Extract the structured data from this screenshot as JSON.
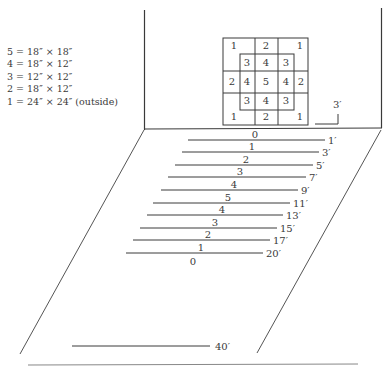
{
  "legend": {
    "items": [
      "5 = 18″ × 18″",
      "4 = 18″ × 12″",
      "3 = 12″ × 12″",
      "2 = 18″ × 12″",
      "1 = 24″ × 24″ (outside)"
    ]
  },
  "target": {
    "outer": {
      "x": 223,
      "y": 38,
      "w": 85,
      "h": 87
    },
    "inner": {
      "x": 240,
      "y": 54,
      "w": 54,
      "h": 56
    },
    "vlines": [
      255,
      278
    ],
    "hlines": [
      70,
      93
    ],
    "cells": [
      {
        "label": "1",
        "x": 234,
        "y": 49
      },
      {
        "label": "2",
        "x": 266,
        "y": 49
      },
      {
        "label": "1",
        "x": 300,
        "y": 49
      },
      {
        "label": "3",
        "x": 247,
        "y": 66
      },
      {
        "label": "4",
        "x": 266,
        "y": 66
      },
      {
        "label": "3",
        "x": 286,
        "y": 66
      },
      {
        "label": "2",
        "x": 232,
        "y": 85
      },
      {
        "label": "4",
        "x": 247,
        "y": 85
      },
      {
        "label": "5",
        "x": 266,
        "y": 85
      },
      {
        "label": "4",
        "x": 286,
        "y": 85
      },
      {
        "label": "2",
        "x": 301,
        "y": 85
      },
      {
        "label": "3",
        "x": 247,
        "y": 104
      },
      {
        "label": "4",
        "x": 266,
        "y": 104
      },
      {
        "label": "3",
        "x": 286,
        "y": 104
      },
      {
        "label": "1",
        "x": 234,
        "y": 120
      },
      {
        "label": "2",
        "x": 266,
        "y": 120
      },
      {
        "label": "1",
        "x": 300,
        "y": 120
      }
    ]
  },
  "height_marker": {
    "label": "3′"
  },
  "throw_lines": [
    {
      "score": "0",
      "distance": "1′",
      "x1": 188,
      "x2": 325,
      "y": 140,
      "lx": 255
    },
    {
      "score": "1",
      "distance": "3′",
      "x1": 182,
      "x2": 319,
      "y": 152,
      "lx": 252
    },
    {
      "score": "2",
      "distance": "5′",
      "x1": 175,
      "x2": 313,
      "y": 165,
      "lx": 246
    },
    {
      "score": "3",
      "distance": "7′",
      "x1": 168,
      "x2": 306,
      "y": 177,
      "lx": 240
    },
    {
      "score": "4",
      "distance": "9′",
      "x1": 161,
      "x2": 298,
      "y": 190,
      "lx": 234
    },
    {
      "score": "5",
      "distance": "11′",
      "x1": 153,
      "x2": 290,
      "y": 203,
      "lx": 228
    },
    {
      "score": "4",
      "distance": "13′",
      "x1": 147,
      "x2": 283,
      "y": 215,
      "lx": 222
    },
    {
      "score": "3",
      "distance": "15′",
      "x1": 140,
      "x2": 277,
      "y": 228,
      "lx": 215
    },
    {
      "score": "2",
      "distance": "17′",
      "x1": 133,
      "x2": 270,
      "y": 240,
      "lx": 208
    },
    {
      "score": "1",
      "distance": "20′",
      "x1": 126,
      "x2": 263,
      "y": 253,
      "lx": 201
    }
  ],
  "after_last_label": {
    "score": "0",
    "x": 193,
    "y": 265
  },
  "far_line": {
    "distance": "40′",
    "x1": 72,
    "x2": 210,
    "y": 346
  }
}
